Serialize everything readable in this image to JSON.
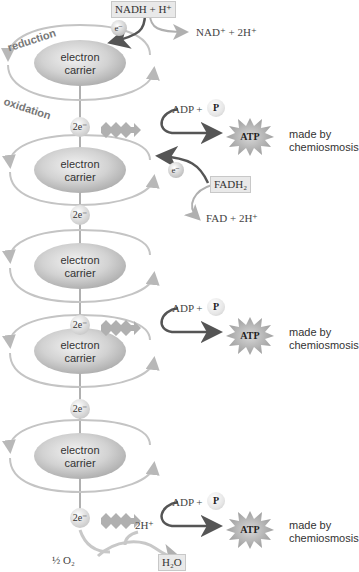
{
  "diagram": {
    "type": "electron transport chain",
    "top_input": {
      "label": "NADH + H⁺",
      "electron": "e⁻",
      "output": "NAD⁺ + 2H⁺"
    },
    "side_labels": {
      "reduction": "reduction",
      "oxidation": "oxidation"
    },
    "carriers": [
      {
        "label_line1": "electron",
        "label_line2": "carrier"
      },
      {
        "label_line1": "electron",
        "label_line2": "carrier"
      },
      {
        "label_line1": "electron",
        "label_line2": "carrier"
      },
      {
        "label_line1": "electron",
        "label_line2": "carrier"
      },
      {
        "label_line1": "electron",
        "label_line2": "carrier"
      }
    ],
    "electron_pairs": [
      "2e⁻",
      "2e⁻",
      "2e⁻",
      "2e⁻",
      "2e⁻"
    ],
    "atp_events": [
      {
        "adp": "ADP +",
        "p": "P",
        "atp": "ATP",
        "note_line1": "made by",
        "note_line2": "chemiosmosis"
      },
      {
        "adp": "ADP +",
        "p": "P",
        "atp": "ATP",
        "note_line1": "made by",
        "note_line2": "chemiosmosis"
      },
      {
        "adp": "ADP +",
        "p": "P",
        "atp": "ATP",
        "note_line1": "made by",
        "note_line2": "chemiosmosis"
      }
    ],
    "fadh2_input": {
      "label": "FADH₂",
      "electron": "e⁻",
      "output": "FAD + 2H⁺"
    },
    "final": {
      "oxygen": "½ O₂",
      "protons": "2H⁺",
      "water": "H₂O"
    },
    "colors": {
      "carrier_fill": "#c8c8c8",
      "arc": "#b4b4b4",
      "dark_arrow": "#555555",
      "light_arrow": "#b0b0b0",
      "starburst": "#a8a8a8"
    }
  }
}
